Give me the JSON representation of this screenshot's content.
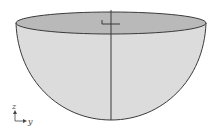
{
  "figure": {
    "colors": {
      "body_fill": "#dcdcdc",
      "top_fill": "#b9b9b9",
      "stroke": "#3a3a3a",
      "background": "#ffffff"
    }
  },
  "axes_indicator": {
    "vertical_label": "z",
    "horizontal_label": "y"
  }
}
